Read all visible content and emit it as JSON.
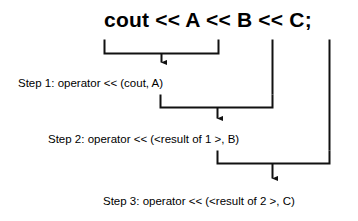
{
  "diagram": {
    "title": "cout << A << B << C;",
    "type": "cpp-operator-chaining-evaluation-order",
    "expression": {
      "text": "cout << A << B << C;",
      "operands": [
        "cout",
        "A",
        "B",
        "C"
      ],
      "operator": "<<"
    },
    "steps": [
      {
        "number": 1,
        "label": "Step 1: operator << (cout, A)",
        "operator": "<<",
        "arguments": [
          "cout",
          "A"
        ]
      },
      {
        "number": 2,
        "label": "Step 2: operator << (<result of 1 >, B)",
        "operator": "<<",
        "arguments": [
          "<result of 1 >",
          "B"
        ]
      },
      {
        "number": 3,
        "label": "Step 3: operator << (<result of 2 >, C)",
        "operator": "<<",
        "arguments": [
          "<result of 2 >",
          "C"
        ]
      }
    ],
    "colors": {
      "ink": "#000000",
      "background": "#ffffff",
      "connector": "#1a1a1a"
    }
  }
}
